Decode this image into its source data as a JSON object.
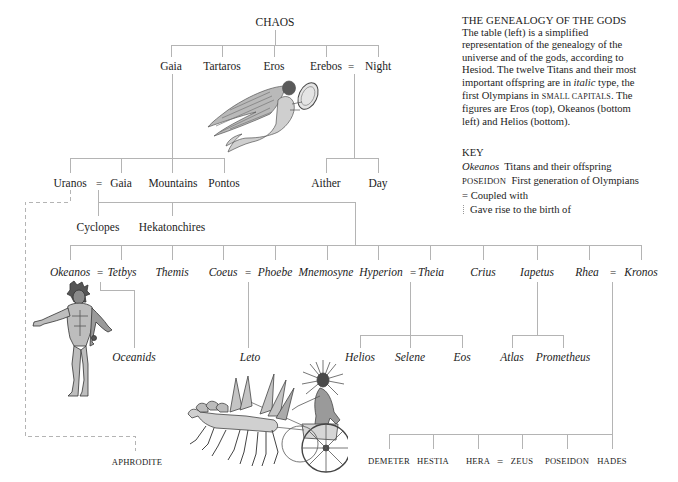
{
  "info": {
    "title": "THE GENEALOGY OF THE GODS",
    "lines": [
      "The table (left) is a simplified",
      "representation of the genealogy of the",
      "universe and of the gods, according to",
      "Hesiod. The twelve Titans and their most"
    ],
    "line5": {
      "before": "important offspring are in ",
      "italic": "italic",
      "after": " type, the"
    },
    "line6": {
      "before": "first Olympians in ",
      "smallcaps": "SMALL CAPITALS",
      "after": ". The"
    },
    "line7": "figures are Eros (top), Okeanos (bottom",
    "line8": "left) and Helios (bottom)."
  },
  "key": {
    "heading": "KEY",
    "rows": [
      {
        "sample": "Okeanos",
        "text": "Titans and their offspring"
      },
      {
        "sample": "POSEIDON",
        "text": "First generation of Olympians"
      },
      {
        "sample": "=",
        "text": "Coupled with"
      },
      {
        "sample": "dotted-line",
        "text": "Gave rise to the birth of"
      }
    ]
  },
  "tree": {
    "couple": "=",
    "root": "CHAOS",
    "level1": [
      "Gaia",
      "Tartaros",
      "Eros",
      "Erebos",
      "Night"
    ],
    "level2": [
      "Uranos",
      "Gaia",
      "Mountains",
      "Pontos"
    ],
    "erebos_children": [
      "Aither",
      "Day"
    ],
    "uranos_children": [
      "Cyclopes",
      "Hekatonchires"
    ],
    "titans": [
      "Okeanos",
      "Tetbys",
      "Themis",
      "Coeus",
      "Phoebe",
      "Mnemosyne",
      "Hyperion",
      "Theia",
      "Crius",
      "Iapetus",
      "Rhea",
      "Kronos"
    ],
    "titan_offspring": [
      "Oceanids",
      "Leto",
      "Helios",
      "Selene",
      "Eos",
      "Atlas",
      "Prometheus"
    ],
    "olympians": [
      "DEMETER",
      "HESTIA",
      "HERA",
      "ZEUS",
      "POSEIDON",
      "HADES"
    ],
    "aphrodite": "APHRODITE"
  },
  "figures": [
    "Eros",
    "Okeanos",
    "Helios"
  ],
  "colors": {
    "line": "#b4b4b4",
    "text": "#1c1c1c",
    "engraving": "#6a6a6a"
  }
}
